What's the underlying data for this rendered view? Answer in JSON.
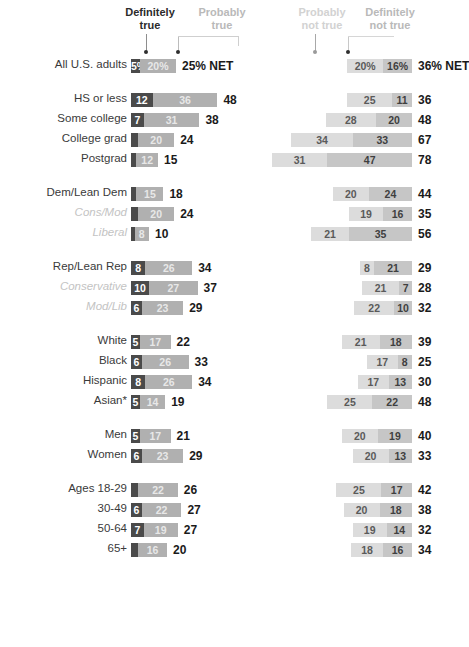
{
  "header": {
    "left_label_1": "Definitely\ntrue",
    "left_label_2": "Probably\ntrue",
    "right_label_1": "Probably\nnot true",
    "right_label_2": "Definitely\nnot true"
  },
  "colors": {
    "definitely_true": "#4a4a4a",
    "probably_true": "#b0b0b0",
    "probably_not_true": "#dcdcdc",
    "definitely_not_true": "#c6c6c6",
    "net_text": "#1a1a1a",
    "label_text": "#3a3a3a",
    "sub_label_text": "#c3c3c3"
  },
  "net_suffix": "% NET",
  "chart_data": {
    "type": "bar",
    "title": "",
    "xlabel": "",
    "ylabel": "",
    "layout": "diverging-stacked-bar",
    "grid": false,
    "legend_position": "top",
    "legend": [
      "Definitely true",
      "Probably true",
      "Probably not true",
      "Definitely not true"
    ],
    "series": [
      {
        "name": "Definitely true",
        "side": "left"
      },
      {
        "name": "Probably true",
        "side": "left"
      },
      {
        "name": "Probably not true",
        "side": "right"
      },
      {
        "name": "Definitely not true",
        "side": "right"
      }
    ],
    "groups": [
      {
        "id": "all",
        "rows": [
          {
            "label": "All U.S. adults",
            "sub": false,
            "definitely_true": 5,
            "probably_true": 20,
            "net_true": 25,
            "probably_not_true": 20,
            "definitely_not_true": 16,
            "net_not_true": 36,
            "def_true_display": "5%",
            "prob_true_display": "20%",
            "prob_not_display": "20%",
            "def_not_display": "16%",
            "net_true_display": "25% NET",
            "net_not_display": "36% NET"
          }
        ]
      },
      {
        "id": "education",
        "rows": [
          {
            "label": "HS or less",
            "sub": false,
            "definitely_true": 12,
            "probably_true": 36,
            "net_true": 48,
            "probably_not_true": 25,
            "definitely_not_true": 11,
            "net_not_true": 36,
            "def_true_display": "12",
            "prob_true_display": "36",
            "prob_not_display": "25",
            "def_not_display": "11",
            "net_true_display": "48",
            "net_not_display": "36"
          },
          {
            "label": "Some college",
            "sub": false,
            "definitely_true": 7,
            "probably_true": 31,
            "net_true": 38,
            "probably_not_true": 28,
            "definitely_not_true": 20,
            "net_not_true": 48,
            "def_true_display": "7",
            "prob_true_display": "31",
            "prob_not_display": "28",
            "def_not_display": "20",
            "net_true_display": "38",
            "net_not_display": "48"
          },
          {
            "label": "College grad",
            "sub": false,
            "definitely_true": 4,
            "probably_true": 20,
            "net_true": 24,
            "probably_not_true": 34,
            "definitely_not_true": 33,
            "net_not_true": 67,
            "def_true_display": "",
            "prob_true_display": "20",
            "prob_not_display": "34",
            "def_not_display": "33",
            "net_true_display": "24",
            "net_not_display": "67"
          },
          {
            "label": "Postgrad",
            "sub": false,
            "definitely_true": 3,
            "probably_true": 12,
            "net_true": 15,
            "probably_not_true": 31,
            "definitely_not_true": 47,
            "net_not_true": 78,
            "def_true_display": "",
            "prob_true_display": "12",
            "prob_not_display": "31",
            "def_not_display": "47",
            "net_true_display": "15",
            "net_not_display": "78"
          }
        ]
      },
      {
        "id": "democrats",
        "rows": [
          {
            "label": "Dem/Lean Dem",
            "sub": false,
            "definitely_true": 3,
            "probably_true": 15,
            "net_true": 18,
            "probably_not_true": 20,
            "definitely_not_true": 24,
            "net_not_true": 44,
            "def_true_display": "",
            "prob_true_display": "15",
            "prob_not_display": "20",
            "def_not_display": "24",
            "net_true_display": "18",
            "net_not_display": "44"
          },
          {
            "label": "Cons/Mod",
            "sub": true,
            "definitely_true": 4,
            "probably_true": 20,
            "net_true": 24,
            "probably_not_true": 19,
            "definitely_not_true": 16,
            "net_not_true": 35,
            "def_true_display": "",
            "prob_true_display": "20",
            "prob_not_display": "19",
            "def_not_display": "16",
            "net_true_display": "24",
            "net_not_display": "35"
          },
          {
            "label": "Liberal",
            "sub": true,
            "definitely_true": 2,
            "probably_true": 8,
            "net_true": 10,
            "probably_not_true": 21,
            "definitely_not_true": 35,
            "net_not_true": 56,
            "def_true_display": "",
            "prob_true_display": "8",
            "prob_not_display": "21",
            "def_not_display": "35",
            "net_true_display": "10",
            "net_not_display": "56"
          }
        ]
      },
      {
        "id": "republicans",
        "rows": [
          {
            "label": "Rep/Lean Rep",
            "sub": false,
            "definitely_true": 8,
            "probably_true": 26,
            "net_true": 34,
            "probably_not_true": 8,
            "definitely_not_true": 21,
            "net_not_true": 29,
            "def_true_display": "8",
            "prob_true_display": "26",
            "prob_not_display": "8",
            "def_not_display": "21",
            "net_true_display": "34",
            "net_not_display": "29"
          },
          {
            "label": "Conservative",
            "sub": true,
            "definitely_true": 10,
            "probably_true": 27,
            "net_true": 37,
            "probably_not_true": 21,
            "definitely_not_true": 7,
            "net_not_true": 28,
            "def_true_display": "10",
            "prob_true_display": "27",
            "prob_not_display": "21",
            "def_not_display": "7",
            "net_true_display": "37",
            "net_not_display": "28"
          },
          {
            "label": "Mod/Lib",
            "sub": true,
            "definitely_true": 6,
            "probably_true": 23,
            "net_true": 29,
            "probably_not_true": 22,
            "definitely_not_true": 10,
            "net_not_true": 32,
            "def_true_display": "6",
            "prob_true_display": "23",
            "prob_not_display": "22",
            "def_not_display": "10",
            "net_true_display": "29",
            "net_not_display": "32"
          }
        ]
      },
      {
        "id": "race",
        "rows": [
          {
            "label": "White",
            "sub": false,
            "definitely_true": 5,
            "probably_true": 17,
            "net_true": 22,
            "probably_not_true": 21,
            "definitely_not_true": 18,
            "net_not_true": 39,
            "def_true_display": "5",
            "prob_true_display": "17",
            "prob_not_display": "21",
            "def_not_display": "18",
            "net_true_display": "22",
            "net_not_display": "39"
          },
          {
            "label": "Black",
            "sub": false,
            "definitely_true": 6,
            "probably_true": 26,
            "net_true": 33,
            "probably_not_true": 17,
            "definitely_not_true": 8,
            "net_not_true": 25,
            "def_true_display": "6",
            "prob_true_display": "26",
            "prob_not_display": "17",
            "def_not_display": "8",
            "net_true_display": "33",
            "net_not_display": "25"
          },
          {
            "label": "Hispanic",
            "sub": false,
            "definitely_true": 8,
            "probably_true": 26,
            "net_true": 34,
            "probably_not_true": 17,
            "definitely_not_true": 13,
            "net_not_true": 30,
            "def_true_display": "8",
            "prob_true_display": "26",
            "prob_not_display": "17",
            "def_not_display": "13",
            "net_true_display": "34",
            "net_not_display": "30"
          },
          {
            "label": "Asian*",
            "sub": false,
            "definitely_true": 5,
            "probably_true": 14,
            "net_true": 19,
            "probably_not_true": 25,
            "definitely_not_true": 22,
            "net_not_true": 48,
            "def_true_display": "5",
            "prob_true_display": "14",
            "prob_not_display": "25",
            "def_not_display": "22",
            "net_true_display": "19",
            "net_not_display": "48"
          }
        ]
      },
      {
        "id": "gender",
        "rows": [
          {
            "label": "Men",
            "sub": false,
            "definitely_true": 5,
            "probably_true": 17,
            "net_true": 21,
            "probably_not_true": 20,
            "definitely_not_true": 19,
            "net_not_true": 40,
            "def_true_display": "5",
            "prob_true_display": "17",
            "prob_not_display": "20",
            "def_not_display": "19",
            "net_true_display": "21",
            "net_not_display": "40"
          },
          {
            "label": "Women",
            "sub": false,
            "definitely_true": 6,
            "probably_true": 23,
            "net_true": 29,
            "probably_not_true": 20,
            "definitely_not_true": 13,
            "net_not_true": 33,
            "def_true_display": "6",
            "prob_true_display": "23",
            "prob_not_display": "20",
            "def_not_display": "13",
            "net_true_display": "29",
            "net_not_display": "33"
          }
        ]
      },
      {
        "id": "age",
        "rows": [
          {
            "label": "Ages 18-29",
            "sub": false,
            "definitely_true": 4,
            "probably_true": 22,
            "net_true": 26,
            "probably_not_true": 25,
            "definitely_not_true": 17,
            "net_not_true": 42,
            "def_true_display": "",
            "prob_true_display": "22",
            "prob_not_display": "25",
            "def_not_display": "17",
            "net_true_display": "26",
            "net_not_display": "42"
          },
          {
            "label": "30-49",
            "sub": false,
            "definitely_true": 6,
            "probably_true": 22,
            "net_true": 27,
            "probably_not_true": 20,
            "definitely_not_true": 18,
            "net_not_true": 38,
            "def_true_display": "6",
            "prob_true_display": "22",
            "prob_not_display": "20",
            "def_not_display": "18",
            "net_true_display": "27",
            "net_not_display": "38"
          },
          {
            "label": "50-64",
            "sub": false,
            "definitely_true": 7,
            "probably_true": 19,
            "net_true": 27,
            "probably_not_true": 19,
            "definitely_not_true": 14,
            "net_not_true": 32,
            "def_true_display": "7",
            "prob_true_display": "19",
            "prob_not_display": "19",
            "def_not_display": "14",
            "net_true_display": "27",
            "net_not_display": "32"
          },
          {
            "label": "65+",
            "sub": false,
            "definitely_true": 4,
            "probably_true": 16,
            "net_true": 20,
            "probably_not_true": 18,
            "definitely_not_true": 16,
            "net_not_true": 34,
            "def_true_display": "",
            "prob_true_display": "16",
            "prob_not_display": "18",
            "def_not_display": "16",
            "net_true_display": "20",
            "net_not_display": "34"
          }
        ]
      }
    ]
  }
}
